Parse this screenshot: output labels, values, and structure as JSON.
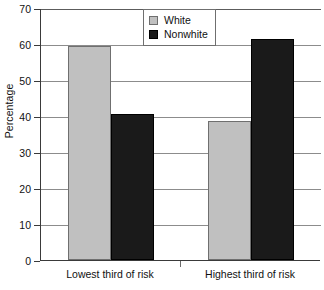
{
  "chart_data": {
    "type": "bar",
    "title": "",
    "xlabel": "",
    "ylabel": "Percentage",
    "categories": [
      "Lowest third of risk",
      "Highest third of risk"
    ],
    "series": [
      {
        "name": "White",
        "color": "#c0c0c0",
        "values": [
          59.4,
          38.6
        ]
      },
      {
        "name": "Nonwhite",
        "color": "#1a1a1a",
        "values": [
          40.6,
          61.4
        ]
      }
    ],
    "ylim": [
      0,
      70
    ],
    "yticks": [
      0,
      10,
      20,
      30,
      40,
      50,
      60,
      70
    ],
    "ytick_labels": [
      "0",
      "10",
      "20",
      "30",
      "40",
      "50",
      "60",
      "70"
    ],
    "grid": true,
    "legend_position": "top-center"
  }
}
